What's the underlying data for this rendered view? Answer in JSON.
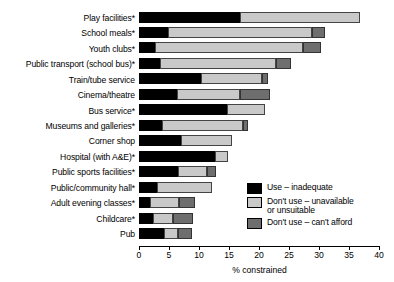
{
  "chart_data": {
    "type": "bar",
    "orientation": "horizontal",
    "stacked": true,
    "title": "",
    "xlabel": "% constrained",
    "ylabel": "",
    "xlim": [
      0,
      40
    ],
    "xticks": [
      0,
      5,
      10,
      15,
      20,
      25,
      30,
      35,
      40
    ],
    "grid": false,
    "legend_position": "inside-right",
    "categories": [
      "Play facilities*",
      "School meals*",
      "Youth clubs*",
      "Public transport (school bus)*",
      "Train/tube service",
      "Cinema/theatre",
      "Bus service*",
      "Museums and galleries*",
      "Corner shop",
      "Hospital (with A&E)*",
      "Public sports facilities*",
      "Public/community hall*",
      "Adult evening classes*",
      "Childcare*",
      "Pub"
    ],
    "series": [
      {
        "name": "Use – inadequate",
        "color": "#000000",
        "values": [
          16.8,
          4.8,
          2.7,
          3.5,
          10.3,
          6.3,
          14.7,
          3.8,
          7.0,
          12.7,
          6.5,
          3.0,
          1.8,
          2.3,
          4.2
        ]
      },
      {
        "name": "Don't use – unavailable\nor unsuitable",
        "color": "#c9c9c9",
        "values": [
          20.0,
          24.0,
          24.7,
          19.3,
          10.2,
          10.5,
          6.3,
          13.5,
          8.5,
          2.1,
          4.8,
          9.2,
          4.9,
          3.4,
          2.3
        ]
      },
      {
        "name": "Don't use – can't afford",
        "color": "#6e6e6e",
        "values": [
          0.0,
          2.2,
          2.9,
          2.5,
          1.0,
          5.0,
          0.0,
          0.9,
          0.0,
          0.0,
          1.5,
          0.0,
          2.7,
          3.3,
          2.3
        ]
      }
    ],
    "totals": [
      36.8,
      31.0,
      30.3,
      25.3,
      21.5,
      21.8,
      21.0,
      18.2,
      15.5,
      14.8,
      12.8,
      12.2,
      9.4,
      9.0,
      8.8
    ]
  },
  "legend": {
    "items": [
      {
        "label": "Use – inadequate",
        "swatch": "#000000"
      },
      {
        "label": "Don't use – unavailable\nor unsuitable",
        "swatch": "#c9c9c9"
      },
      {
        "label": "Don't use – can't afford",
        "swatch": "#6e6e6e"
      }
    ]
  }
}
